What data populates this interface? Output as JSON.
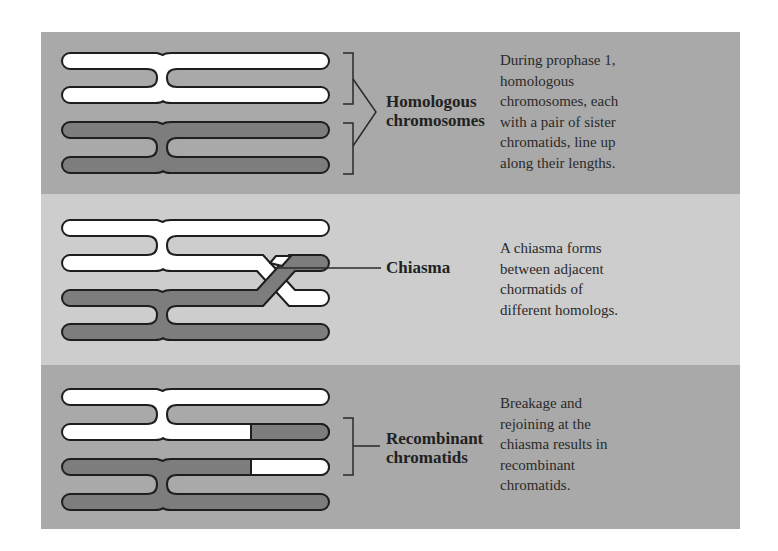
{
  "colors": {
    "panel_dark": "#a9a9a9",
    "panel_light": "#cdcdcd",
    "chromatid_white": "#ffffff",
    "chromatid_dark": "#7d7d7d",
    "outline": "#1e1e1e"
  },
  "panels": [
    {
      "label_line1": "Homologous",
      "label_line2": "chromosomes",
      "description": [
        "During prophase 1,",
        "homologous",
        "chromosomes, each",
        "with a pair of sister",
        "chromatids, line up",
        "along their lengths."
      ]
    },
    {
      "label_line1": "Chiasma",
      "description": [
        "A chiasma forms",
        "between adjacent",
        "chormatids of",
        "different homologs."
      ]
    },
    {
      "label_line1": "Recombinant",
      "label_line2": "chromatids",
      "description": [
        "Breakage and",
        "rejoining at the",
        "chiasma results in",
        "recombinant",
        "chromatids."
      ]
    }
  ]
}
